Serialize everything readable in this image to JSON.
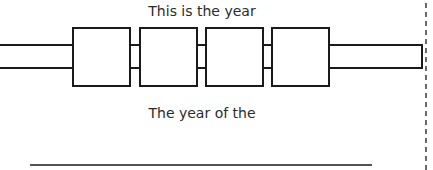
{
  "diagram": {
    "top_label": "This is the year",
    "bottom_label": "The year of the",
    "boxes": [
      {
        "x": 73,
        "label": ""
      },
      {
        "x": 140,
        "label": ""
      },
      {
        "x": 206,
        "label": ""
      },
      {
        "x": 272,
        "label": ""
      }
    ],
    "stroke_color": "#1a1a1a"
  }
}
